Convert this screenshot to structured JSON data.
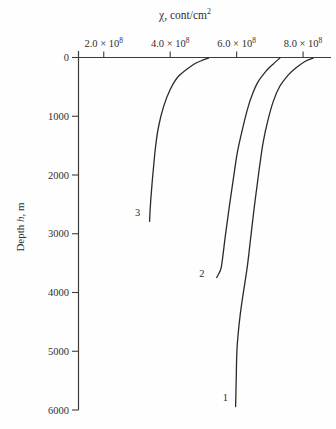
{
  "page": {
    "background": "#fefefe",
    "width": 336,
    "height": 429
  },
  "chart_data": {
    "type": "line",
    "title": {
      "text": "χ, cont/cm",
      "sup": "2"
    },
    "x_axis": {
      "position": "top",
      "range": [
        124000000.0,
        884000000.0
      ],
      "ticks": [
        200000000.0,
        400000000.0,
        600000000.0,
        800000000.0
      ],
      "tick_labels": [
        "2.0 × 10^8",
        "4.0 × 10^8",
        "6.0 × 10^8",
        "8.0 × 10^8"
      ],
      "grid": false
    },
    "y_axis": {
      "label": {
        "pre": "Depth ",
        "var": "h",
        "post": ", m"
      },
      "range": [
        0,
        6000
      ],
      "direction": "down",
      "ticks": [
        0,
        1000,
        2000,
        3000,
        4000,
        5000,
        6000
      ],
      "tick_labels": [
        "0",
        "1000",
        "2000",
        "3000",
        "4000",
        "5000",
        "6000"
      ],
      "grid": false
    },
    "legend": "none",
    "series": [
      {
        "name": "1",
        "label_pos": [
          566000000.0,
          5780
        ],
        "points": [
          [
            830000000.0,
            10
          ],
          [
            808000000.0,
            60
          ],
          [
            780000000.0,
            170
          ],
          [
            755000000.0,
            300
          ],
          [
            730000000.0,
            490
          ],
          [
            710000000.0,
            750
          ],
          [
            695000000.0,
            1050
          ],
          [
            680000000.0,
            1440
          ],
          [
            668000000.0,
            1900
          ],
          [
            656000000.0,
            2410
          ],
          [
            644000000.0,
            2980
          ],
          [
            632000000.0,
            3560
          ],
          [
            617000000.0,
            4120
          ],
          [
            610000000.0,
            4410
          ],
          [
            605000000.0,
            4680
          ],
          [
            601000000.0,
            4970
          ],
          [
            599000000.0,
            5400
          ],
          [
            597000000.0,
            5940
          ]
        ]
      },
      {
        "name": "2",
        "label_pos": [
          495000000.0,
          3670
        ],
        "points": [
          [
            730000000.0,
            10
          ],
          [
            712000000.0,
            100
          ],
          [
            692000000.0,
            210
          ],
          [
            665000000.0,
            410
          ],
          [
            647000000.0,
            630
          ],
          [
            632000000.0,
            890
          ],
          [
            617000000.0,
            1230
          ],
          [
            602000000.0,
            1620
          ],
          [
            590000000.0,
            2070
          ],
          [
            578000000.0,
            2540
          ],
          [
            566000000.0,
            3040
          ],
          [
            554000000.0,
            3560
          ],
          [
            545000000.0,
            3690
          ],
          [
            540000000.0,
            3745
          ]
        ]
      },
      {
        "name": "3",
        "label_pos": [
          302000000.0,
          2640
        ],
        "points": [
          [
            515000000.0,
            10
          ],
          [
            492000000.0,
            60
          ],
          [
            470000000.0,
            120
          ],
          [
            425000000.0,
            320
          ],
          [
            400000000.0,
            545
          ],
          [
            380000000.0,
            835
          ],
          [
            365000000.0,
            1175
          ],
          [
            356000000.0,
            1515
          ],
          [
            350000000.0,
            1855
          ],
          [
            344000000.0,
            2245
          ],
          [
            340000000.0,
            2550
          ],
          [
            338000000.0,
            2790
          ]
        ]
      }
    ],
    "colors": {
      "line": "#2a2a2a",
      "axis": "#3c3c3c",
      "text": "#2e2e2e"
    }
  }
}
